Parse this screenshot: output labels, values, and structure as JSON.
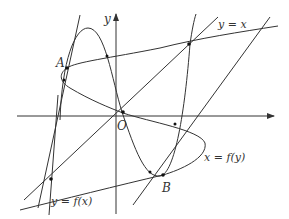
{
  "diagram": {
    "type": "function-and-inverse-graph",
    "colors": {
      "stroke": "#333333",
      "background": "#ffffff"
    },
    "axes": {
      "x_label": "",
      "y_label": "y",
      "origin_label": "O"
    },
    "curve_labels": {
      "line_y_eq_x": "y = x",
      "cubic": "y = f(x)",
      "inverse": "x = f(y)"
    },
    "points": [
      {
        "name": "A",
        "label": "A"
      },
      {
        "name": "B",
        "label": "B"
      },
      {
        "name": "O",
        "label": "O"
      }
    ]
  }
}
